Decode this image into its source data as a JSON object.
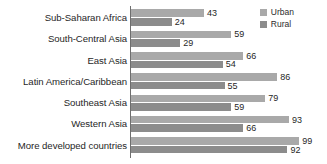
{
  "chart_data": {
    "type": "bar",
    "orientation": "horizontal",
    "title": "",
    "subtitle": "",
    "xlabel": "",
    "ylabel": "",
    "xlim": [
      0,
      100
    ],
    "grid": false,
    "legend_position": "top-right",
    "categories": [
      "Sub-Saharan Africa",
      "South-Central Asia",
      "East Asia",
      "Latin America/Caribbean",
      "Southeast Asia",
      "Western Asia",
      "More developed countries"
    ],
    "series": [
      {
        "name": "Urban",
        "color": "#a9a9a9",
        "values": [
          43,
          59,
          66,
          86,
          79,
          93,
          99
        ]
      },
      {
        "name": "Rural",
        "color": "#8c8c8c",
        "values": [
          24,
          29,
          54,
          55,
          59,
          66,
          92
        ]
      }
    ]
  },
  "legend": {
    "items": [
      {
        "label": "Urban",
        "color": "#a9a9a9"
      },
      {
        "label": "Rural",
        "color": "#8c8c8c"
      }
    ]
  },
  "colors": {
    "urban": "#a9a9a9",
    "rural": "#8c8c8c",
    "axis": "#6e6e6e",
    "text": "#1f1f1f",
    "background": "#ffffff"
  }
}
